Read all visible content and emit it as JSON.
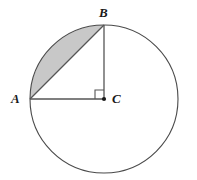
{
  "figure": {
    "type": "geometry-diagram",
    "background_color": "#ffffff",
    "stroke_color": "#3c3c3c",
    "segment_fill_color": "#c8c8c8",
    "labels": {
      "A": "A",
      "B": "B",
      "C": "C"
    },
    "circle": {
      "center_label": "C",
      "center_x": 104,
      "center_y": 99,
      "radius": 74,
      "stroke_width": 1.1
    },
    "points": {
      "A": {
        "x": 30,
        "y": 99,
        "description": "left end of horizontal radius on circle"
      },
      "B": {
        "x": 104,
        "y": 25,
        "description": "top end of vertical radius on circle"
      },
      "C": {
        "x": 104,
        "y": 99,
        "description": "center of circle, marked with dot"
      }
    },
    "segments": [
      {
        "name": "radius-CA",
        "from": "C",
        "to": "A"
      },
      {
        "name": "radius-CB",
        "from": "C",
        "to": "B"
      },
      {
        "name": "chord-AB",
        "from": "A",
        "to": "B"
      }
    ],
    "right_angle": {
      "at": "C",
      "size": 9,
      "description": "square marker indicating 90 degrees between CA and CB"
    },
    "shaded_region": {
      "name": "circular-segment-AB",
      "description": "region bounded by chord AB and minor arc from A to B",
      "fill": "#c8c8c8"
    },
    "center_dot": {
      "radius": 2.1,
      "color": "#1a1a1a"
    }
  }
}
